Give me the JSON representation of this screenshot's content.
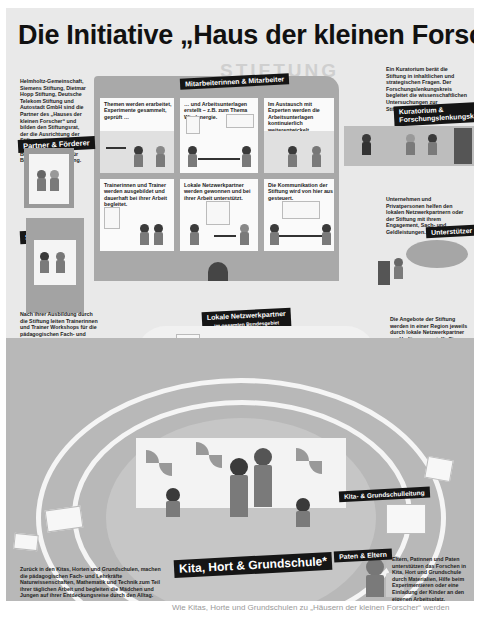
{
  "title": "Die Initiative „Haus der kleinen Forscher“",
  "stiftung_heading": "STIFTUNG",
  "labels": {
    "mitarbeiter": "Mitarbeiterinnen & Mitarbeiter",
    "partner": "Partner & Förderer",
    "kuratorium": "Kuratorium &",
    "kuratorium_2": "Forschungslenkungskreis",
    "stiftungsrat": "Stiftungsrat",
    "unterstuetzer": "Unterstützer",
    "lokale_netzwerkpartner": "Lokale Netzwerkpartner",
    "lokale_netzwerkpartner_sub": "im gesamten Bundesgebiet",
    "trainer": "Trainerinnen & Trainer",
    "fachkraefte_1": "Pädagogische",
    "fachkraefte_2": "Fach- und Lehrkräfte",
    "leitung": "Kita- & Grundschulleitung",
    "kita": "Kita, Hort & Grundschule*",
    "paten": "Paten & Eltern"
  },
  "texts": {
    "partner_text": "Helmholtz-Gemeinschaft, Siemens Stiftung, Dietmar Hopp Stiftung, Deutsche Telekom Stiftung und Autostadt GmbH sind die Partner des „Hauses der kleinen Forscher“ und bilden den Stiftungsrat, der die Ausrichtung der Stiftung steuert. Gefördert wird sie vom Bundesministerium für Bildung und Forschung.",
    "kuratorium_text": "Ein Kuratorium berät die Stiftung in inhaltlichen und strategischen Fragen. Der Forschungslenkungskreis begleitet die wissenschaftlichen Untersuchungen zur Stiftungsarbeit.",
    "unterstuetzer_text": "Unternehmen und Privatpersonen helfen den lokalen Netzwerkpartnern oder der Stiftung mit ihrem Engagement, Sach- und Geldleistungen.",
    "trainer_text_1": "Nach ihrer Ausbildung durch die Stiftung leiten Trainerinnen und Trainer Workshops für die pädagogischen Fach- und Lehrkräfte in ihrem lokalen Netzwerk.",
    "trainer_text_2": "Wenn sich eine Kita, ein Hort oder eine Grundschule entschlossen hat, ein „Haus der kleinen Forscher“ zu werden, schickt die Einrichtung die pädagogischen Fach- und Lehrkräfte zu den Workshops in ihrem Netzwerk.",
    "netzwerk_text": "Die Angebote der Stiftung werden in einer Region jeweils durch lokale Netzwerkpartner zur Verfügung gestellt. Sie werben und betreuen Kitas, Horte und Grundschulen, organisieren die Workshops, übernehmen die regionale Öffentlichkeitsarbeit und zertifizieren die Einrichtungen als „Häuser der kleinen Forscher“.",
    "kita_text": "Zurück in den Kitas, Horten und Grundschulen, machen die pädagogischen Fach- und Lehrkräfte Naturwissenschaften, Mathematik und Technik zum Teil ihrer täglichen Arbeit und begleiten die Mädchen und Jungen auf ihrer Entdeckungsreise durch den Alltag.",
    "paten_text": "Eltern, Patinnen und Paten unterstützen das Forschen in Kita, Hort und Grundschule durch Materialien, Hilfe beim Experimentieren oder eine Einladung der Kinder an den eigenen Arbeitsplatz."
  },
  "cells": [
    "Themen werden erarbeitet, Experimente gesammelt, geprüft …",
    "… und Arbeitsunterlagen erstellt – z.B. zum Thema Windenergie.",
    "Im Austausch mit Experten werden die Arbeitsunterlagen kontinuierlich weiterentwickelt.",
    "Trainerinnen und Trainer werden ausgebildet und dauerhaft bei ihrer Arbeit begleitet.",
    "Lokale Netzwerkpartner werden gewonnen und bei ihrer Arbeit unterstützt.",
    "Die Kommunikation der Stiftung wird von hier aus gesteuert."
  ],
  "caption": "Wie Kitas, Horte und Grundschulen zu „Häusern der kleinen Forscher“ werden"
}
